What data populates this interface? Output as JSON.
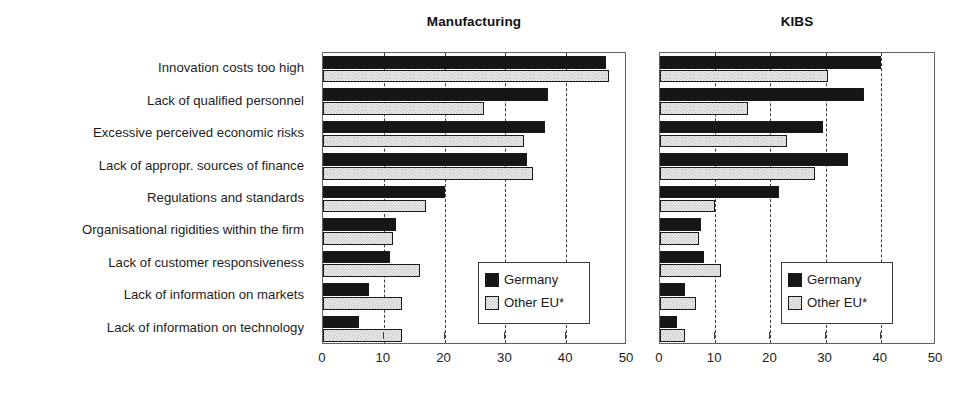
{
  "chart_data": {
    "type": "bar",
    "orientation": "horizontal",
    "title": "",
    "grid": true,
    "legend_position": "inside-right",
    "xlabel": "",
    "ylabel": "",
    "xlim": [
      0,
      50
    ],
    "xticks": [
      0,
      10,
      20,
      30,
      40,
      50
    ],
    "xtick_labels": [
      "0",
      "10",
      "20",
      "30",
      "40",
      "50"
    ],
    "categories": [
      "Innovation costs too high",
      "Lack of qualified personnel",
      "Excessive perceived economic risks",
      "Lack of appropr. sources of finance",
      "Regulations and standards",
      "Organisational rigidities within the firm",
      "Lack of customer responsiveness",
      "Lack of information on markets",
      "Lack of information on technology"
    ],
    "legend": [
      {
        "name": "Germany",
        "color": "#161616",
        "pattern": "solid"
      },
      {
        "name": "Other EU*",
        "color": "#c9c9c9",
        "pattern": "hatched"
      }
    ],
    "panels": [
      {
        "title": "Manufacturing",
        "series": [
          {
            "name": "Germany",
            "values": [
              46.5,
              37.0,
              36.5,
              33.5,
              20.0,
              12.0,
              11.0,
              7.5,
              6.0
            ]
          },
          {
            "name": "Other EU*",
            "values": [
              47.0,
              26.5,
              33.0,
              34.5,
              17.0,
              11.5,
              16.0,
              13.0,
              13.0
            ]
          }
        ]
      },
      {
        "title": "KIBS",
        "series": [
          {
            "name": "Germany",
            "values": [
              40.0,
              37.0,
              29.5,
              34.0,
              21.5,
              7.5,
              8.0,
              4.5,
              3.0
            ]
          },
          {
            "name": "Other EU*",
            "values": [
              30.5,
              16.0,
              23.0,
              28.0,
              10.0,
              7.0,
              11.0,
              6.5,
              4.5
            ]
          }
        ]
      }
    ]
  },
  "footnote": ""
}
